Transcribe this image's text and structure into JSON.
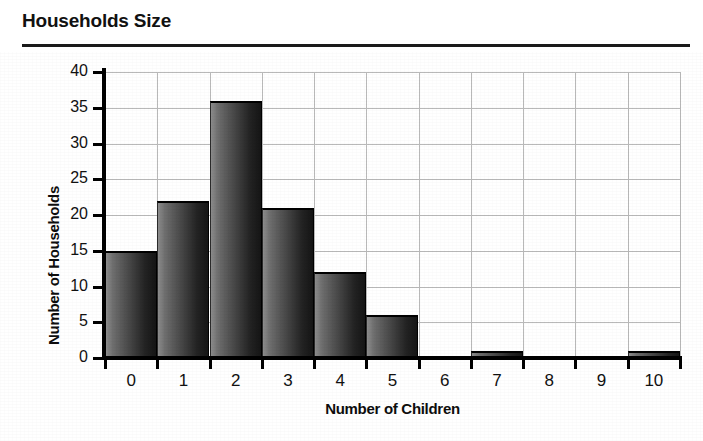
{
  "title": "Households Size",
  "colors": {
    "bar_light": "#8c8c8c",
    "bar_dark": "#151515",
    "grid": "#b9b9b9",
    "axis": "#000000",
    "text": "#111111"
  },
  "chart_data": {
    "type": "bar",
    "title": "Households Size",
    "xlabel": "Number of Children",
    "ylabel": "Number of Households",
    "categories": [
      "0",
      "1",
      "2",
      "3",
      "4",
      "5",
      "6",
      "7",
      "8",
      "9",
      "10"
    ],
    "values": [
      15,
      22,
      36,
      21,
      12,
      6,
      0,
      1,
      0,
      0,
      1
    ],
    "xticklabels": [
      "0",
      "1",
      "2",
      "3",
      "4",
      "5",
      "6",
      "7",
      "8",
      "9",
      "10"
    ],
    "yticklabels": [
      "0",
      "5",
      "10",
      "15",
      "20",
      "25",
      "30",
      "35",
      "40"
    ],
    "yticks": [
      0,
      5,
      10,
      15,
      20,
      25,
      30,
      35,
      40
    ],
    "ylim": [
      0,
      40
    ],
    "grid": true,
    "legend": null
  }
}
